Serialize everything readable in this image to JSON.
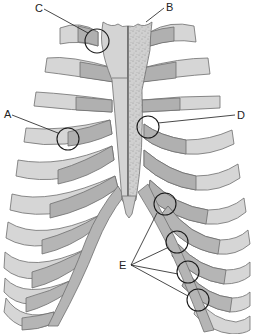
{
  "diagram": {
    "colors": {
      "background": "#ffffff",
      "bone_light": "#d6d6d6",
      "bone_mid": "#bdbdbd",
      "cartilage": "#a9a9a9",
      "outline": "#6e6e6e",
      "sternum_speckle": "#c8c8c8",
      "leader_line": "#1a1a1a"
    },
    "labels": [
      {
        "id": "A",
        "text": "A",
        "x": 4,
        "y": 109,
        "target": "costochondral joint (left rib 4)",
        "circle": {
          "cx": 68,
          "cy": 139,
          "r": 11
        }
      },
      {
        "id": "B",
        "text": "B",
        "x": 166,
        "y": 2,
        "target": "sternum (manubrium, stippled half)",
        "circle": null
      },
      {
        "id": "C",
        "text": "C",
        "x": 35,
        "y": 3,
        "target": "sternoclavicular / first costal cartilage joint",
        "circle": {
          "cx": 97,
          "cy": 41,
          "r": 12
        }
      },
      {
        "id": "D",
        "text": "D",
        "x": 237,
        "y": 110,
        "target": "sternocostal joint (right side)",
        "circle": {
          "cx": 148,
          "cy": 127,
          "r": 11
        }
      },
      {
        "id": "E",
        "text": "E",
        "x": 119,
        "y": 262,
        "target": "interchondral joints",
        "circles": [
          {
            "cx": 165,
            "cy": 204,
            "r": 11
          },
          {
            "cx": 177,
            "cy": 242,
            "r": 11
          },
          {
            "cx": 188,
            "cy": 272,
            "r": 11
          },
          {
            "cx": 198,
            "cy": 300,
            "r": 11
          }
        ]
      }
    ]
  }
}
